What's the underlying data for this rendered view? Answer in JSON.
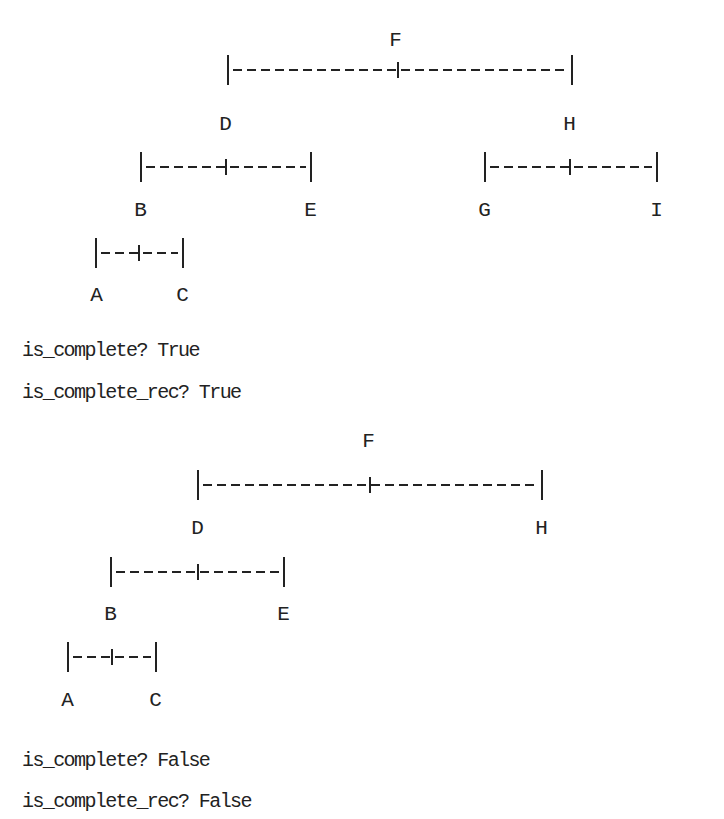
{
  "trees": [
    {
      "nodes": [
        {
          "label": "F",
          "x": 395,
          "y": 40
        },
        {
          "label": "D",
          "x": 225,
          "y": 124
        },
        {
          "label": "H",
          "x": 569,
          "y": 124
        },
        {
          "label": "B",
          "x": 140,
          "y": 210
        },
        {
          "label": "E",
          "x": 310,
          "y": 210
        },
        {
          "label": "G",
          "x": 484,
          "y": 210
        },
        {
          "label": "I",
          "x": 656,
          "y": 210
        },
        {
          "label": "A",
          "x": 96,
          "y": 295
        },
        {
          "label": "C",
          "x": 182,
          "y": 295
        }
      ],
      "connectors": [
        {
          "left": 227,
          "right": 571,
          "mid": 397,
          "y": 70
        },
        {
          "left": 140,
          "right": 310,
          "mid": 225,
          "y": 167
        },
        {
          "left": 484,
          "right": 656,
          "mid": 569,
          "y": 167
        },
        {
          "left": 95,
          "right": 182,
          "mid": 138,
          "y": 253
        }
      ]
    },
    {
      "nodes": [
        {
          "label": "F",
          "x": 368,
          "y": 441
        },
        {
          "label": "D",
          "x": 197,
          "y": 528
        },
        {
          "label": "H",
          "x": 541,
          "y": 528
        },
        {
          "label": "B",
          "x": 110,
          "y": 614
        },
        {
          "label": "E",
          "x": 283,
          "y": 614
        },
        {
          "label": "A",
          "x": 67,
          "y": 700
        },
        {
          "label": "C",
          "x": 155,
          "y": 700
        }
      ],
      "connectors": [
        {
          "left": 197,
          "right": 541,
          "mid": 369,
          "y": 485
        },
        {
          "left": 110,
          "right": 283,
          "mid": 197,
          "y": 572
        },
        {
          "left": 67,
          "right": 155,
          "mid": 111,
          "y": 657
        }
      ]
    }
  ],
  "output_lines": [
    {
      "text": "is_complete? True",
      "y": 350
    },
    {
      "text": "is_complete_rec? True",
      "y": 392
    },
    {
      "text": "is_complete? False",
      "y": 760
    },
    {
      "text": "is_complete_rec? False",
      "y": 801
    }
  ]
}
